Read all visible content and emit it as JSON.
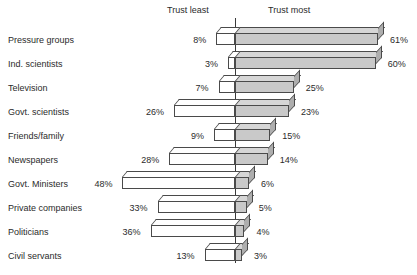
{
  "chart_data": {
    "type": "bar",
    "title": "",
    "subtitle": "",
    "xlabel": "",
    "ylabel": "",
    "orientation": "horizontal",
    "style": "diverging-3d-bar",
    "grid": false,
    "legend_position": "top",
    "axis_captions": {
      "left": "Trust least",
      "right": "Trust most"
    },
    "categories": [
      "Pressure groups",
      "Ind. scientists",
      "Television",
      "Govt. scientists",
      "Friends/family",
      "Newspapers",
      "Govt. Ministers",
      "Private companies",
      "Politicians",
      "Civil servants"
    ],
    "series": [
      {
        "name": "Trust least",
        "side": "left",
        "unit": "%",
        "values": [
          8,
          3,
          7,
          26,
          9,
          28,
          48,
          33,
          36,
          13
        ],
        "labels": [
          "8%",
          "3%",
          "7%",
          "26%",
          "9%",
          "28%",
          "48%",
          "33%",
          "36%",
          "13%"
        ]
      },
      {
        "name": "Trust most",
        "side": "right",
        "unit": "%",
        "values": [
          61,
          60,
          25,
          23,
          15,
          14,
          6,
          5,
          4,
          3
        ],
        "labels": [
          "61%",
          "60%",
          "25%",
          "23%",
          "15%",
          "14%",
          "6%",
          "5%",
          "4%",
          "3%"
        ]
      }
    ],
    "xlim": [
      -50,
      65
    ],
    "colors": {
      "trust_most_fill": "#c9c9c9",
      "trust_least_fill": "#ffffff",
      "outline": "#4a4a4a",
      "axis": "#3a3a3a",
      "text": "#2b2b2b",
      "background": "#ffffff"
    }
  }
}
